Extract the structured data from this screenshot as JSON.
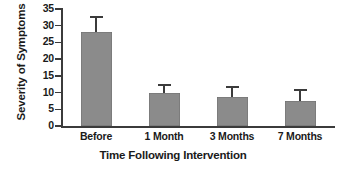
{
  "chart_data": {
    "type": "bar",
    "title": "",
    "xlabel": "Time Following Intervention",
    "ylabel": "Severity of Symptoms",
    "categories": [
      "Before",
      "1 Month",
      "3 Months",
      "7 Months"
    ],
    "values": [
      28,
      10,
      8.7,
      7.5
    ],
    "errors": [
      4.3,
      2.1,
      2.7,
      3.0
    ],
    "error_type": "error-bar",
    "ylim": [
      0,
      35
    ],
    "yticks": [
      0,
      5,
      10,
      15,
      20,
      25,
      30,
      35
    ],
    "ytick_labels": [
      "0",
      "5",
      "10",
      "15",
      "20",
      "25",
      "30",
      "35"
    ],
    "grid": false,
    "legend": null,
    "bar_color": "#8b8b8b",
    "axis_color": "#3b3b3b",
    "background": "#ffffff"
  }
}
